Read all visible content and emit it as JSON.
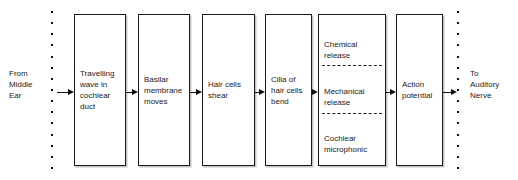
{
  "diagram": {
    "type": "flowchart",
    "orientation": "left-to-right",
    "line_color": "#1a1a1a",
    "background_color": "#ffffff"
  },
  "terminals": {
    "left": {
      "label": "From\nMiddle\nEar",
      "name": "from-middle-ear"
    },
    "right": {
      "label": "To\nAuditory\nNerve",
      "name": "to-auditory-nerve"
    }
  },
  "rails": {
    "left": {
      "dot_count": 15,
      "name": "left-boundary-dotted-line"
    },
    "right": {
      "dot_count": 15,
      "name": "right-boundary-dotted-line"
    }
  },
  "boxes": [
    {
      "id": "box-1",
      "label": "Travelling\nwave in\ncochlear\nduct"
    },
    {
      "id": "box-2",
      "label": "Basilar\nmembrane\nmoves"
    },
    {
      "id": "box-3",
      "label": "Hair cells\nshear"
    },
    {
      "id": "box-4",
      "label": "Cilia of\nhair cells\nbend"
    },
    {
      "id": "box-5",
      "compartmented": true,
      "compartments": [
        "Chemical\nrelease",
        "Mechanical\nrelease",
        "Cochlear\nmicrophonic"
      ]
    },
    {
      "id": "box-6",
      "label": "Action\npotential"
    }
  ],
  "arrows": [
    {
      "id": "arrow-0",
      "from": "from-middle-ear",
      "to": "box-1"
    },
    {
      "id": "arrow-1",
      "from": "box-1",
      "to": "box-2"
    },
    {
      "id": "arrow-2",
      "from": "box-2",
      "to": "box-3"
    },
    {
      "id": "arrow-3",
      "from": "box-3",
      "to": "box-4"
    },
    {
      "id": "arrow-4",
      "from": "box-4",
      "to": "box-5"
    },
    {
      "id": "arrow-5",
      "from": "box-5",
      "to": "box-6"
    },
    {
      "id": "arrow-6",
      "from": "box-6",
      "to": "to-auditory-nerve"
    }
  ]
}
